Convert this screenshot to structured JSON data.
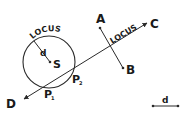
{
  "diagram": {
    "circle_locus": {
      "label": "LOCUS",
      "center_label": "S",
      "radius_label": "d"
    },
    "line_locus": {
      "label": "LOCUS",
      "end_label_start": "D",
      "end_label_end": "C"
    },
    "segment_ab": {
      "start_label": "A",
      "end_label": "B"
    },
    "intersections": {
      "p1_main": "P",
      "p1_sub": "1",
      "p2_main": "P",
      "p2_sub": "2"
    },
    "distance_key": {
      "label": "d"
    },
    "colors": {
      "stroke": "#2a2a2a",
      "text": "#1a1a1a",
      "background": "#ffffff"
    }
  }
}
